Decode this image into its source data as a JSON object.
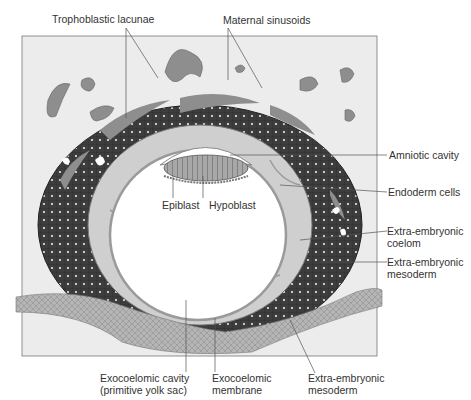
{
  "diagram": {
    "labels": {
      "trophoblastic_lacunae": "Trophoblastic lacunae",
      "maternal_sinusoids": "Maternal sinusoids",
      "amniotic_cavity": "Amniotic cavity",
      "endoderm_cells": "Endoderm cells",
      "epiblast": "Epiblast",
      "hypoblast": "Hypoblast",
      "extra_embryonic_coelom_1": "Extra-embryonic",
      "extra_embryonic_coelom_2": "coelom",
      "extra_embryonic_mesoderm_right_1": "Extra-embryonic",
      "extra_embryonic_mesoderm_right_2": "mesoderm",
      "exocoelomic_cavity_1": "Exocoelomic cavity",
      "exocoelomic_cavity_2": "(primitive yolk sac)",
      "exocoelomic_membrane_1": "Exocoelomic",
      "exocoelomic_membrane_2": "membrane",
      "extra_embryonic_mesoderm_bottom_1": "Extra-embryonic",
      "extra_embryonic_mesoderm_bottom_2": "mesoderm"
    },
    "colors": {
      "background_panel": "#ececec",
      "trophoblast": "#3d3d3d",
      "lacunae": "#8e8e8e",
      "mesoderm": "#cfcfcf",
      "cavity": "#ffffff",
      "epithelium": "#9a9a9a",
      "leader_line": "#555555"
    }
  }
}
